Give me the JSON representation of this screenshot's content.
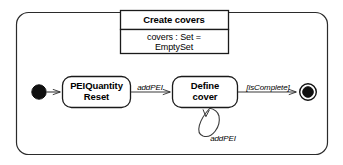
{
  "diagram": {
    "type": "uml-state-machine",
    "outer_frame": {
      "name": "Create covers",
      "attribute": "covers : Set =",
      "attribute_line2": "EmptySet"
    },
    "states": [
      {
        "id": "initial",
        "kind": "initial-pseudostate",
        "label": ""
      },
      {
        "id": "peiquantity-reset",
        "kind": "simple-state",
        "label_line1": "PEIQuantity",
        "label_line2": "Reset"
      },
      {
        "id": "define-cover",
        "kind": "simple-state",
        "label_line1": "Define",
        "label_line2": "cover"
      },
      {
        "id": "final",
        "kind": "final-state",
        "label": ""
      }
    ],
    "transitions": [
      {
        "id": "t-start",
        "from": "initial",
        "to": "peiquantity-reset",
        "label": ""
      },
      {
        "id": "t-addpei",
        "from": "peiquantity-reset",
        "to": "define-cover",
        "label": "addPEI"
      },
      {
        "id": "t-selfloop",
        "from": "define-cover",
        "to": "define-cover",
        "label": "addPEI"
      },
      {
        "id": "t-iscomplete",
        "from": "define-cover",
        "to": "final",
        "label": "[isComplete]"
      }
    ],
    "colors": {
      "stroke": "#1a1a1a",
      "fill": "#ffffff",
      "text": "#000000"
    }
  }
}
